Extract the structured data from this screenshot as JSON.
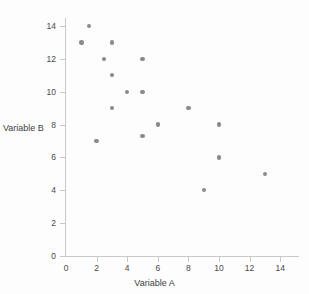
{
  "chart_data": {
    "type": "scatter",
    "title": "",
    "xlabel": "Variable A",
    "ylabel": "Variable B",
    "xlim": [
      0,
      15.3
    ],
    "ylim": [
      0,
      14.5
    ],
    "xticks": [
      0,
      2,
      4,
      6,
      8,
      10,
      12,
      14
    ],
    "yticks": [
      0,
      2,
      4,
      6,
      8,
      10,
      12,
      14
    ],
    "grid": false,
    "legend": null,
    "marker_color": "#8a8a8a",
    "axis_color": "#c9c9c9",
    "points": [
      {
        "x": 1.5,
        "y": 14
      },
      {
        "x": 1,
        "y": 13
      },
      {
        "x": 3,
        "y": 13
      },
      {
        "x": 2.5,
        "y": 12
      },
      {
        "x": 5,
        "y": 12
      },
      {
        "x": 3,
        "y": 11
      },
      {
        "x": 4,
        "y": 10
      },
      {
        "x": 5,
        "y": 10
      },
      {
        "x": 3,
        "y": 9
      },
      {
        "x": 8,
        "y": 9
      },
      {
        "x": 6,
        "y": 8
      },
      {
        "x": 10,
        "y": 8
      },
      {
        "x": 5,
        "y": 7.3
      },
      {
        "x": 2,
        "y": 7
      },
      {
        "x": 10,
        "y": 6
      },
      {
        "x": 13,
        "y": 5
      },
      {
        "x": 9,
        "y": 4
      }
    ]
  },
  "axis_titles": {
    "x": "Variable A",
    "y": "Variable B"
  }
}
